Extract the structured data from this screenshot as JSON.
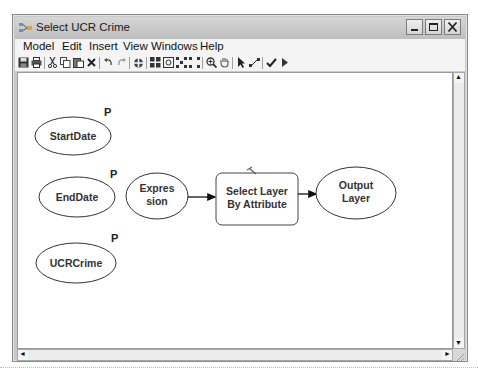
{
  "window": {
    "title": "Select UCR Crime",
    "controls": {
      "minimize": "_",
      "maximize": "□",
      "close": "X"
    }
  },
  "menubar": {
    "items": [
      {
        "label": "Model"
      },
      {
        "label": "Edit"
      },
      {
        "label": "Insert"
      },
      {
        "label": "View"
      },
      {
        "label": "Windows"
      },
      {
        "label": "Help"
      }
    ]
  },
  "toolbar": {
    "icons": [
      "save-icon",
      "print-icon",
      "cut-icon",
      "copy-icon",
      "paste-icon",
      "delete-icon",
      "undo-icon",
      "redo-icon",
      "add-data-icon",
      "auto-layout-icon",
      "full-extent-icon",
      "fit-to-window-icon",
      "select-all-icon",
      "zoom-in-icon",
      "pan-icon",
      "select-pointer-icon",
      "connect-icon",
      "validate-icon",
      "run-icon"
    ]
  },
  "model": {
    "nodes": [
      {
        "id": "startdate",
        "type": "variable",
        "label": "StartDate",
        "parameter": "P"
      },
      {
        "id": "enddate",
        "type": "variable",
        "label": "EndDate",
        "parameter": "P"
      },
      {
        "id": "ucrcrime",
        "type": "variable",
        "label": "UCRCrime",
        "parameter": "P"
      },
      {
        "id": "expression",
        "type": "variable",
        "label_line1": "Expres",
        "label_line2": "sion"
      },
      {
        "id": "select-layer",
        "type": "tool",
        "label_line1": "Select Layer",
        "label_line2": "By Attribute"
      },
      {
        "id": "output-layer",
        "type": "variable",
        "label_line1": "Output",
        "label_line2": "Layer"
      }
    ],
    "connections": [
      {
        "from": "expression",
        "to": "select-layer"
      },
      {
        "from": "select-layer",
        "to": "output-layer"
      }
    ]
  },
  "scrollbars": {
    "vertical": {
      "up": "▲",
      "down": "▼"
    },
    "horizontal": {
      "left": "◄",
      "right": "►"
    }
  }
}
